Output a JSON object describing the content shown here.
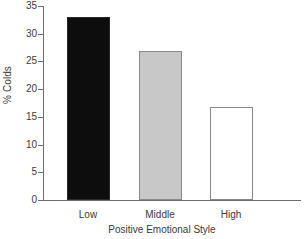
{
  "chart_data": {
    "type": "bar",
    "title": "",
    "categories": [
      "Low",
      "Middle",
      "High"
    ],
    "values": [
      33.0,
      26.9,
      16.7
    ],
    "series": [
      {
        "name": "% Colds",
        "values": [
          33.0,
          26.9,
          16.7
        ]
      }
    ],
    "xlabel": "Positive Emotional Style",
    "ylabel": "% Colds",
    "ylim": [
      0,
      35
    ],
    "yticks": [
      0,
      5,
      10,
      15,
      20,
      25,
      30,
      35
    ],
    "ytick_labels": [
      "0",
      "5",
      "10",
      "15",
      "20",
      "25",
      "30",
      "35"
    ],
    "grid": false,
    "legend": false,
    "bar_colors": [
      "#0d0d0d",
      "#c8c8c8",
      "#ffffff"
    ],
    "bar_edge_colors": [
      "#2a2a2a",
      "#8a8a8a",
      "#8a8a8a"
    ],
    "axis_color": "#6e6e6e",
    "text_color": "#3a3a3a",
    "background": "#ffffff"
  }
}
